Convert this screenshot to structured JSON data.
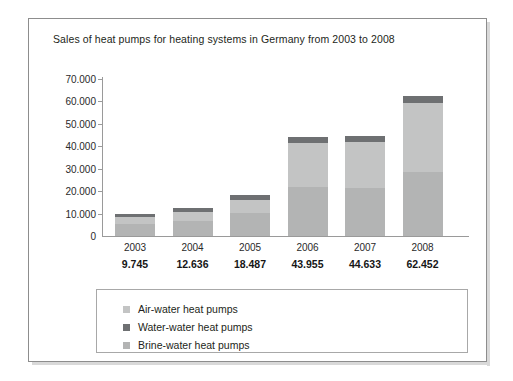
{
  "chart_data": {
    "type": "bar",
    "subtype": "stacked-bar",
    "title": "Sales of heat pumps for heating systems in Germany from 2003 to 2008",
    "xlabel": "",
    "ylabel": "",
    "categories": [
      "2003",
      "2004",
      "2005",
      "2006",
      "2007",
      "2008"
    ],
    "totals": [
      "9.745",
      "12.636",
      "18.487",
      "43.955",
      "44.633",
      "62.452"
    ],
    "totals_numeric": [
      9745,
      12636,
      18487,
      43955,
      44633,
      62452
    ],
    "series": [
      {
        "name": "Brine-water heat pumps",
        "color": "#b3b4b4",
        "values": [
          5400,
          6500,
          10100,
          22000,
          21600,
          28500
        ]
      },
      {
        "name": "Air-water heat pumps",
        "color": "#c3c4c4",
        "values": [
          2900,
          4400,
          5900,
          19400,
          20400,
          31000
        ]
      },
      {
        "name": "Water-water heat pumps",
        "color": "#6e7072",
        "values": [
          1445,
          1736,
          2487,
          2555,
          2633,
          2952
        ]
      }
    ],
    "stack_order_bottom_to_top": [
      "Brine-water heat pumps",
      "Air-water heat pumps",
      "Water-water heat pumps"
    ],
    "ylim": [
      0,
      70000
    ],
    "yticks": [
      0,
      10000,
      20000,
      30000,
      40000,
      50000,
      60000,
      70000
    ],
    "ytick_labels": [
      "0",
      "10.000",
      "20.000",
      "30.000",
      "40.000",
      "50.000",
      "60.000",
      "70.000"
    ],
    "grid": false,
    "legend_position": "bottom"
  },
  "legend": {
    "entries": [
      {
        "label": "Air-water heat pumps",
        "swatch": "#c3c4c4"
      },
      {
        "label": "Water-water heat pumps",
        "swatch": "#6e7072"
      },
      {
        "label": "Brine-water heat pumps",
        "swatch": "#b3b4b4"
      }
    ]
  }
}
